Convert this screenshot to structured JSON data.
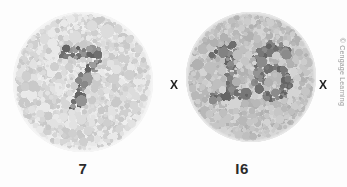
{
  "figure": {
    "background_color": "#fdfdfd",
    "width": 347,
    "height": 187,
    "credit": "© Cengage Learning",
    "credit_color": "#9a9a9a"
  },
  "plates": [
    {
      "id": "plate-left",
      "hidden_numeral": "7",
      "label": "7",
      "label_x": 83,
      "label_y": 161,
      "circle": {
        "x": 13,
        "y": 12,
        "d": 140
      },
      "plate_background": "#efefef",
      "dot_palette_light": [
        "#e9e9e9",
        "#e2e2e2",
        "#dcdcdc",
        "#d6d6d6",
        "#cfcfcf",
        "#c9c9c9"
      ],
      "dot_palette_dark": [
        "#9d9d9d",
        "#939393",
        "#888888",
        "#7d7d7d",
        "#6f6f6f",
        "#636363"
      ],
      "dot_contrast": "low",
      "dot_count": 1150,
      "seed": 20137
    },
    {
      "id": "plate-right",
      "hidden_numeral": "16",
      "label": "I6",
      "label_x": 242,
      "label_y": 161,
      "circle": {
        "x": 186,
        "y": 12,
        "d": 130
      },
      "plate_background": "#d7d7d7",
      "dot_palette_light": [
        "#d4d4d4",
        "#cdcdcd",
        "#c6c6c6",
        "#bfbfbf",
        "#b8b8b8",
        "#b1b1b1"
      ],
      "dot_palette_dark": [
        "#949494",
        "#8b8b8b",
        "#828282",
        "#787878",
        "#6e6e6e",
        "#646464"
      ],
      "dot_contrast": "high",
      "dot_count": 1000,
      "seed": 77016
    }
  ],
  "markers": [
    {
      "name": "x-marker-left",
      "label": "X",
      "x": 170,
      "y": 79
    },
    {
      "name": "x-marker-right",
      "label": "X",
      "x": 319,
      "y": 79
    }
  ]
}
